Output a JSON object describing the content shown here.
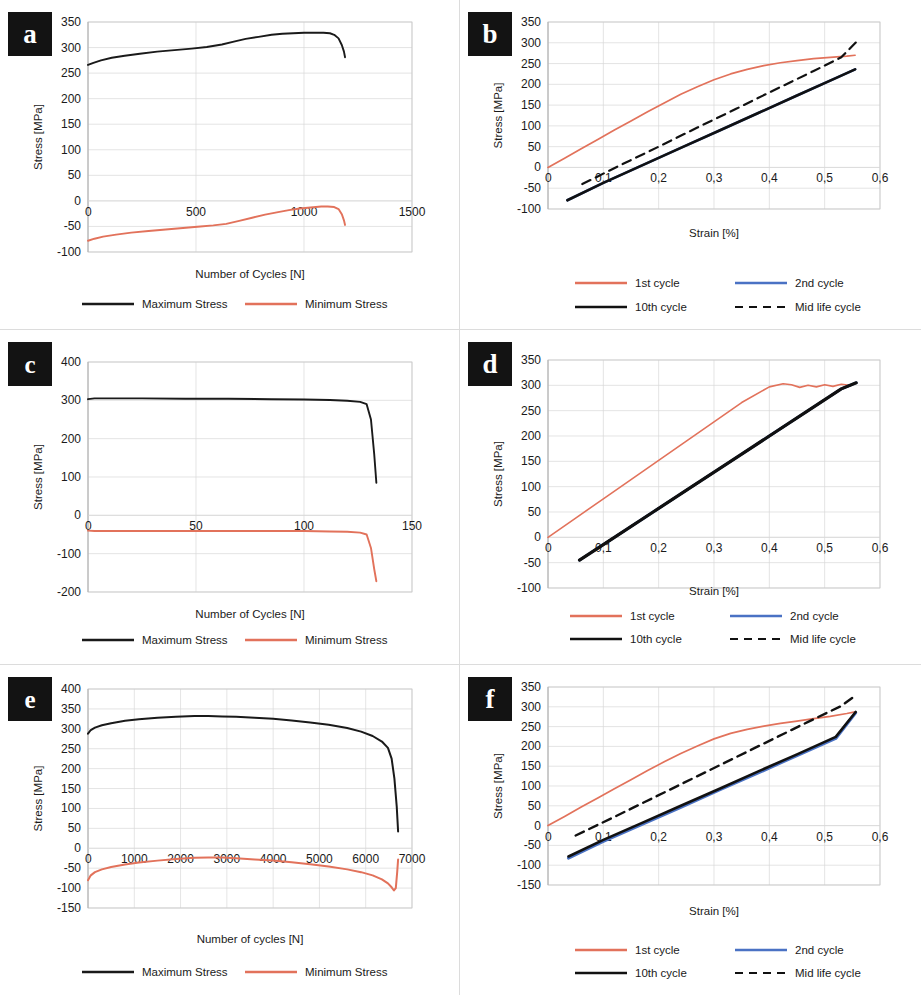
{
  "figure": {
    "type": "multi-panel-figure",
    "panel_count": 6,
    "colors": {
      "max_stress": "#1a1a1a",
      "min_stress": "#e2725b",
      "cycle_1st": "#e2725b",
      "cycle_2nd": "#4a72c4",
      "cycle_10th": "#111111",
      "cycle_midlife": "#111111",
      "gridline": "#d9d9d9",
      "axis": "#b0b0b0"
    }
  },
  "panels": {
    "a": {
      "letter": "a"
    },
    "b": {
      "letter": "b"
    },
    "c": {
      "letter": "c"
    },
    "d": {
      "letter": "d"
    },
    "e": {
      "letter": "e"
    },
    "f": {
      "letter": "f"
    }
  },
  "chart_data": [
    {
      "id": "a",
      "panel_letter": "a",
      "type": "line",
      "title": "",
      "xlabel": "Number of Cycles [N]",
      "ylabel": "Stress [MPa]",
      "xlim": [
        0,
        1500
      ],
      "ylim": [
        -100,
        350
      ],
      "xticks": [
        0,
        500,
        1000,
        1500
      ],
      "xticklabels": [
        "0",
        "500",
        "1000",
        "1500"
      ],
      "yticks": [
        -100,
        -50,
        0,
        50,
        100,
        150,
        200,
        250,
        300,
        350
      ],
      "yticklabels": [
        "-100",
        "-50",
        "0",
        "50",
        "100",
        "150",
        "200",
        "250",
        "300",
        "350"
      ],
      "grid": true,
      "legend_position": "bottom",
      "series": [
        {
          "name": "Maximum Stress",
          "color": "#1a1a1a",
          "style": "solid",
          "width": 1.9,
          "x": [
            0,
            25,
            60,
            110,
            170,
            240,
            320,
            400,
            480,
            550,
            620,
            680,
            730,
            790,
            850,
            900,
            950,
            1000,
            1050,
            1090,
            1120,
            1140,
            1160,
            1175,
            1185,
            1190
          ],
          "y": [
            266,
            270,
            275,
            280,
            284,
            288,
            292,
            295,
            298,
            301,
            306,
            312,
            317,
            321,
            325,
            327,
            328,
            329,
            329,
            329,
            328,
            325,
            318,
            305,
            292,
            281
          ]
        },
        {
          "name": "Minimum Stress",
          "color": "#e2725b",
          "style": "solid",
          "width": 1.9,
          "x": [
            0,
            30,
            70,
            130,
            200,
            280,
            360,
            440,
            520,
            580,
            640,
            700,
            760,
            820,
            880,
            930,
            980,
            1030,
            1080,
            1110,
            1140,
            1160,
            1175,
            1185,
            1190
          ],
          "y": [
            -78,
            -74,
            -70,
            -66,
            -62,
            -59,
            -56,
            -53,
            -50,
            -48,
            -45,
            -39,
            -33,
            -27,
            -22,
            -18,
            -15,
            -13,
            -11,
            -11,
            -12,
            -16,
            -26,
            -38,
            -47
          ]
        }
      ]
    },
    {
      "id": "b",
      "panel_letter": "b",
      "type": "line",
      "title": "",
      "xlabel": "Strain [%]",
      "ylabel": "Stress [MPa]",
      "xlim": [
        0,
        0.6
      ],
      "ylim": [
        -100,
        350
      ],
      "xticks": [
        0,
        0.1,
        0.2,
        0.3,
        0.4,
        0.5,
        0.6
      ],
      "xticklabels": [
        "0",
        "0,1",
        "0,2",
        "0,3",
        "0,4",
        "0,5",
        "0,6"
      ],
      "yticks": [
        -100,
        -50,
        0,
        50,
        100,
        150,
        200,
        250,
        300,
        350
      ],
      "yticklabels": [
        "-100",
        "-50",
        "0",
        "50",
        "100",
        "150",
        "200",
        "250",
        "300",
        "350"
      ],
      "grid": true,
      "legend_position": "bottom",
      "series": [
        {
          "name": "1st cycle",
          "color": "#e2725b",
          "style": "solid",
          "width": 1.7,
          "x": [
            0.0,
            0.03,
            0.06,
            0.09,
            0.12,
            0.15,
            0.18,
            0.21,
            0.24,
            0.27,
            0.3,
            0.33,
            0.36,
            0.39,
            0.42,
            0.45,
            0.48,
            0.51,
            0.54,
            0.555
          ],
          "y": [
            0,
            22,
            45,
            67,
            90,
            112,
            134,
            155,
            176,
            194,
            211,
            225,
            236,
            245,
            252,
            257,
            262,
            265,
            268,
            270
          ]
        },
        {
          "name": "2nd cycle",
          "color": "#4a72c4",
          "style": "solid",
          "width": 2.6,
          "x": [
            0.035,
            0.1,
            0.17,
            0.24,
            0.31,
            0.38,
            0.45,
            0.52,
            0.555
          ],
          "y": [
            -79,
            -37,
            5,
            47,
            89,
            131,
            173,
            215,
            236
          ]
        },
        {
          "name": "10th cycle",
          "color": "#111111",
          "style": "solid",
          "width": 2.6,
          "x": [
            0.035,
            0.1,
            0.17,
            0.24,
            0.31,
            0.38,
            0.45,
            0.52,
            0.555
          ],
          "y": [
            -79,
            -37,
            5,
            47,
            89,
            131,
            173,
            215,
            236
          ]
        },
        {
          "name": "Mid life cycle",
          "color": "#111111",
          "style": "dashed",
          "width": 2.2,
          "x": [
            0.062,
            0.13,
            0.2,
            0.27,
            0.34,
            0.41,
            0.48,
            0.53,
            0.558
          ],
          "y": [
            -40,
            5,
            50,
            96,
            141,
            187,
            232,
            265,
            303
          ]
        }
      ]
    },
    {
      "id": "c",
      "panel_letter": "c",
      "type": "line",
      "title": "",
      "xlabel": "Number of Cycles [N]",
      "ylabel": "Stress [MPa]",
      "xlim": [
        0,
        150
      ],
      "ylim": [
        -200,
        400
      ],
      "xticks": [
        0,
        50,
        100,
        150
      ],
      "xticklabels": [
        "0",
        "50",
        "100",
        "150"
      ],
      "yticks": [
        -200,
        -100,
        0,
        100,
        200,
        300,
        400
      ],
      "yticklabels": [
        "-200",
        "-100",
        "0",
        "100",
        "200",
        "300",
        "400"
      ],
      "grid": true,
      "legend_position": "bottom",
      "series": [
        {
          "name": "Maximum Stress",
          "color": "#1a1a1a",
          "style": "solid",
          "width": 1.9,
          "x": [
            0,
            3,
            10,
            25,
            45,
            65,
            85,
            100,
            112,
            120,
            126,
            129,
            131,
            132.5,
            133.5
          ],
          "y": [
            303,
            305,
            305,
            305,
            304,
            304,
            303,
            302,
            301,
            299,
            296,
            290,
            250,
            160,
            85
          ]
        },
        {
          "name": "Minimum Stress",
          "color": "#e2725b",
          "style": "solid",
          "width": 1.9,
          "x": [
            0,
            3,
            10,
            25,
            45,
            65,
            85,
            100,
            112,
            120,
            126,
            129,
            131,
            132.5,
            133.5
          ],
          "y": [
            -40,
            -41,
            -41,
            -41,
            -41,
            -41,
            -41,
            -41,
            -42,
            -43,
            -45,
            -50,
            -85,
            -140,
            -172
          ]
        }
      ]
    },
    {
      "id": "d",
      "panel_letter": "d",
      "type": "line",
      "title": "",
      "xlabel": "Strain [%]",
      "ylabel": "Stress [MPa]",
      "xlim": [
        0,
        0.6
      ],
      "ylim": [
        -100,
        350
      ],
      "xticks": [
        0,
        0.1,
        0.2,
        0.3,
        0.4,
        0.5,
        0.6
      ],
      "xticklabels": [
        "0",
        "0,1",
        "0,2",
        "0,3",
        "0,4",
        "0,5",
        "0,6"
      ],
      "yticks": [
        -100,
        -50,
        0,
        50,
        100,
        150,
        200,
        250,
        300,
        350
      ],
      "yticklabels": [
        "-100",
        "-50",
        "0",
        "50",
        "100",
        "150",
        "200",
        "250",
        "300",
        "350"
      ],
      "grid": true,
      "legend_position": "bottom",
      "series": [
        {
          "name": "1st cycle",
          "color": "#e2725b",
          "style": "solid",
          "width": 1.6,
          "x": [
            0.0,
            0.05,
            0.1,
            0.15,
            0.2,
            0.25,
            0.3,
            0.35,
            0.4,
            0.425,
            0.44,
            0.455,
            0.47,
            0.485,
            0.5,
            0.515,
            0.53,
            0.545,
            0.557
          ],
          "y": [
            0,
            38,
            76,
            114,
            152,
            190,
            228,
            266,
            297,
            303,
            301,
            296,
            300,
            297,
            301,
            298,
            302,
            300,
            305
          ]
        },
        {
          "name": "2nd cycle",
          "color": "#4a72c4",
          "style": "solid",
          "width": 2.8,
          "x": [
            0.057,
            0.12,
            0.19,
            0.26,
            0.33,
            0.4,
            0.47,
            0.53,
            0.557
          ],
          "y": [
            -45,
            0,
            50,
            100,
            150,
            200,
            250,
            293,
            305
          ]
        },
        {
          "name": "10th cycle",
          "color": "#111111",
          "style": "solid",
          "width": 3.2,
          "x": [
            0.057,
            0.12,
            0.19,
            0.26,
            0.33,
            0.4,
            0.47,
            0.53,
            0.557
          ],
          "y": [
            -45,
            0,
            50,
            100,
            150,
            200,
            250,
            293,
            305
          ]
        },
        {
          "name": "Mid life cycle",
          "color": "#111111",
          "style": "dashed",
          "width": 2.2,
          "x": [
            0.057,
            0.12,
            0.19,
            0.26,
            0.33,
            0.4,
            0.47,
            0.53,
            0.557
          ],
          "y": [
            -45,
            0,
            50,
            100,
            150,
            200,
            250,
            293,
            305
          ]
        }
      ]
    },
    {
      "id": "e",
      "panel_letter": "e",
      "type": "line",
      "title": "",
      "xlabel": "Number of cycles [N]",
      "ylabel": "Stress [MPa]",
      "xlim": [
        0,
        7000
      ],
      "ylim": [
        -150,
        400
      ],
      "xticks": [
        0,
        1000,
        2000,
        3000,
        4000,
        5000,
        6000,
        7000
      ],
      "xticklabels": [
        "0",
        "1000",
        "2000",
        "3000",
        "4000",
        "5000",
        "6000",
        "7000"
      ],
      "yticks": [
        -150,
        -100,
        -50,
        0,
        50,
        100,
        150,
        200,
        250,
        300,
        350,
        400
      ],
      "yticklabels": [
        "-150",
        "-100",
        "-50",
        "0",
        "50",
        "100",
        "150",
        "200",
        "250",
        "300",
        "350",
        "400"
      ],
      "grid": true,
      "legend_position": "bottom",
      "series": [
        {
          "name": "Maximum Stress",
          "color": "#1a1a1a",
          "style": "solid",
          "width": 2.0,
          "x": [
            0,
            60,
            150,
            300,
            500,
            800,
            1100,
            1500,
            1900,
            2300,
            2600,
            2900,
            3200,
            3600,
            4000,
            4400,
            4800,
            5200,
            5600,
            5900,
            6150,
            6350,
            6480,
            6560,
            6620,
            6670,
            6700
          ],
          "y": [
            288,
            297,
            303,
            309,
            314,
            320,
            324,
            328,
            330,
            332,
            332,
            331,
            330,
            328,
            325,
            321,
            316,
            310,
            302,
            293,
            282,
            268,
            252,
            225,
            175,
            105,
            42
          ]
        },
        {
          "name": "Minimum Stress",
          "color": "#e2725b",
          "style": "solid",
          "width": 2.0,
          "x": [
            0,
            60,
            150,
            300,
            500,
            800,
            1100,
            1500,
            1900,
            2300,
            2600,
            2900,
            3200,
            3600,
            4000,
            4400,
            4800,
            5200,
            5600,
            5900,
            6150,
            6350,
            6480,
            6560,
            6610,
            6650,
            6680,
            6700
          ],
          "y": [
            -80,
            -68,
            -60,
            -53,
            -47,
            -41,
            -36,
            -31,
            -27,
            -24,
            -23,
            -23,
            -25,
            -28,
            -31,
            -35,
            -40,
            -46,
            -53,
            -60,
            -68,
            -78,
            -88,
            -98,
            -106,
            -100,
            -60,
            -28
          ]
        }
      ]
    },
    {
      "id": "f",
      "panel_letter": "f",
      "type": "line",
      "title": "",
      "xlabel": "Strain [%]",
      "ylabel": "Stress [MPa]",
      "xlim": [
        0,
        0.6
      ],
      "ylim": [
        -150,
        350
      ],
      "xticks": [
        0,
        0.1,
        0.2,
        0.3,
        0.4,
        0.5,
        0.6
      ],
      "xticklabels": [
        "0",
        "0,1",
        "0,2",
        "0,3",
        "0,4",
        "0,5",
        "0,6"
      ],
      "yticks": [
        -150,
        -100,
        -50,
        0,
        50,
        100,
        150,
        200,
        250,
        300,
        350
      ],
      "yticklabels": [
        "-150",
        "-100",
        "-50",
        "0",
        "50",
        "100",
        "150",
        "200",
        "250",
        "300",
        "350"
      ],
      "grid": true,
      "legend_position": "bottom",
      "series": [
        {
          "name": "1st cycle",
          "color": "#e2725b",
          "style": "solid",
          "width": 1.7,
          "x": [
            0.0,
            0.03,
            0.06,
            0.09,
            0.12,
            0.15,
            0.18,
            0.21,
            0.24,
            0.27,
            0.3,
            0.33,
            0.36,
            0.39,
            0.42,
            0.45,
            0.48,
            0.51,
            0.54,
            0.555
          ],
          "y": [
            0,
            23,
            47,
            70,
            93,
            116,
            139,
            161,
            182,
            201,
            219,
            233,
            243,
            251,
            258,
            264,
            270,
            276,
            283,
            287
          ]
        },
        {
          "name": "2nd cycle",
          "color": "#4a72c4",
          "style": "solid",
          "width": 3.0,
          "x": [
            0.037,
            0.1,
            0.17,
            0.24,
            0.31,
            0.38,
            0.45,
            0.52,
            0.556
          ],
          "y": [
            -82,
            -40,
            3,
            46,
            90,
            133,
            177,
            220,
            285
          ]
        },
        {
          "name": "10th cycle",
          "color": "#111111",
          "style": "solid",
          "width": 2.6,
          "x": [
            0.037,
            0.1,
            0.17,
            0.24,
            0.31,
            0.38,
            0.45,
            0.52,
            0.556
          ],
          "y": [
            -78,
            -36,
            7,
            50,
            93,
            137,
            180,
            224,
            287
          ]
        },
        {
          "name": "Mid life cycle",
          "color": "#111111",
          "style": "dashed",
          "width": 2.4,
          "x": [
            0.05,
            0.12,
            0.19,
            0.26,
            0.33,
            0.4,
            0.47,
            0.53,
            0.558
          ],
          "y": [
            -25,
            22,
            70,
            118,
            166,
            214,
            262,
            302,
            331
          ]
        }
      ]
    }
  ],
  "legends": {
    "cycles_ab": [
      {
        "label": "Maximum Stress",
        "color": "#1a1a1a",
        "style": "solid"
      },
      {
        "label": "Minimum Stress",
        "color": "#e2725b",
        "style": "solid"
      }
    ],
    "cycles_strain": [
      {
        "label": "1st cycle",
        "color": "#e2725b",
        "style": "solid"
      },
      {
        "label": "2nd cycle",
        "color": "#4a72c4",
        "style": "solid"
      },
      {
        "label": "10th cycle",
        "color": "#111111",
        "style": "solid"
      },
      {
        "label": "Mid life cycle",
        "color": "#111111",
        "style": "dashed"
      }
    ]
  }
}
